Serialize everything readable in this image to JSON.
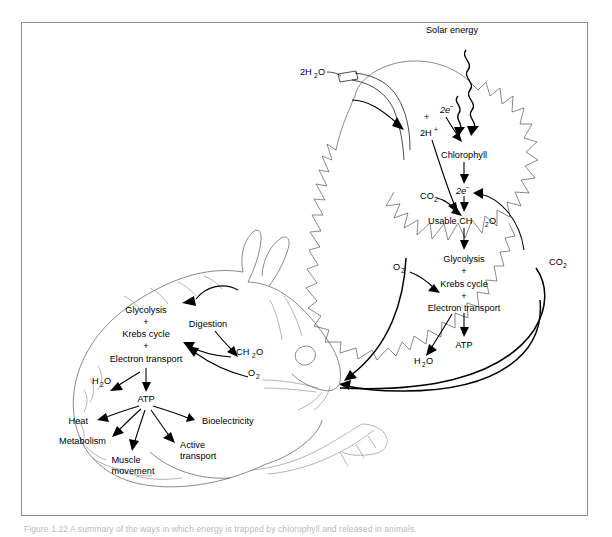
{
  "figure": {
    "caption": "Figure 1.22  A summary of the ways in which energy is trapped by chlorophyll and released in animals.",
    "frame_color": "#8d8d8d",
    "background": "#ffffff"
  },
  "diagram": {
    "type": "flow-diagram",
    "organisms": [
      {
        "name": "leaf",
        "role": "photosynthesis",
        "side": "right"
      },
      {
        "name": "rabbit",
        "role": "cellular-respiration",
        "side": "left"
      }
    ],
    "leaf_labels": {
      "solar_energy": "Solar energy",
      "water_input": "2H",
      "water_input_sub": "2",
      "water_input_tail": "O",
      "electrons_top": "2e",
      "electrons_top_sup": "−",
      "plus_sign": "+",
      "protons": "2H",
      "protons_sup": "+",
      "chlorophyll": "Chlorophyll",
      "electrons_bottom": "2e",
      "electrons_bottom_sup": "−",
      "carbon_dioxide_left": "CO",
      "carbon_dioxide_left_sub": "2",
      "usable_sugar": "Usable CH",
      "usable_sugar_sub": "2",
      "usable_sugar_tail": "O",
      "oxygen": "O",
      "oxygen_sub": "2",
      "glycolysis": "Glycolysis",
      "plus_one": "+",
      "krebs": "Krebs cycle",
      "plus_two": "+",
      "electron_transport": "Electron transport",
      "atp": "ATP",
      "water_output": "H",
      "water_output_sub": "2",
      "water_output_tail": "O",
      "carbon_dioxide_right": "CO",
      "carbon_dioxide_right_sub": "2"
    },
    "animal_labels": {
      "glycolysis": "Glycolysis",
      "plus_one": "+",
      "krebs": "Krebs cycle",
      "plus_two": "+",
      "electron_transport": "Electron transport",
      "digestion": "Digestion",
      "sugar": "CH",
      "sugar_sub": "2",
      "sugar_tail": "O",
      "oxygen": "O",
      "oxygen_sub": "2",
      "water": "H",
      "water_sub": "2",
      "water_tail": "O",
      "atp": "ATP",
      "heat": "Heat",
      "bioelectricity": "Bioelectricity",
      "metabolism": "Metabolism",
      "active_transport_line1": "Active",
      "active_transport_line2": "transport",
      "muscle_line1": "Muscle",
      "muscle_line2": "movement"
    }
  }
}
